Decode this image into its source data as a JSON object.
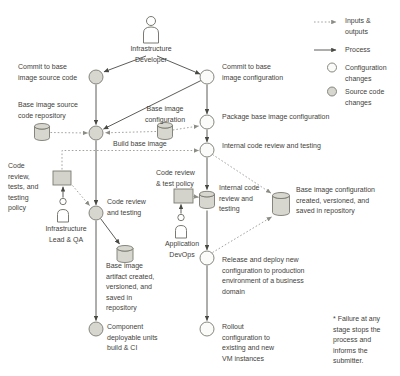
{
  "colors": {
    "background": "#ffffff",
    "text": "#3f3f3c",
    "node-gray": "#d7d7cf",
    "node-white": "#fbfbf9",
    "shape-stroke": "#7a7a72",
    "arrow": "#4a4a45",
    "dotted": "#8c8c85",
    "doc-gray": "#d3d3cb"
  },
  "icons": {
    "person": "person-icon",
    "repository": "database-cylinder-icon",
    "policy": "document-icon"
  },
  "labels": {
    "infra_developer": "Infrastructure\nDeveloper",
    "commit_source": "Commit to base\nimage source code",
    "commit_config": "Commit to base\nimage configuration",
    "source_repo": "Base image source\ncode repository",
    "config_artifact": "Base image\nconfiguration",
    "build": "Build base image",
    "package": "Package base image configuration",
    "internal_review_1": "Internal code review and testing",
    "testing_policy": "Code\nreview,\ntests, and\ntesting\npolicy",
    "infra_lead": "Infrastructure\nLead & QA",
    "code_review": "Code review\nand testing",
    "test_policy": "Code review\n& test policy",
    "app_devops": "Application\nDevOps",
    "internal_review_2": "Internal code\nreview and\ntesting",
    "config_repo": "Base image configuration\ncreated, versioned, and\nsaved in repository",
    "artifact_repo": "Base image\nartifact created,\nversioned, and\nsaved in\nrepository",
    "component_build": "Component\ndeployable units\nbuild & CI",
    "release": "Release and deploy new\nconfiguration to production\nenvironment of a business\ndomain",
    "rollout": "Rollout\nconfiguration to\nexisting and new\nVM instances",
    "footnote": "* Failure at any\nstage stops the\nprocess and\ninforms the\nsubmitter."
  },
  "legend": {
    "inputs_outputs": "Inputs &\noutputs",
    "process": "Process",
    "config_changes": "Configuration\nchanges",
    "source_changes": "Source code\nchanges"
  }
}
